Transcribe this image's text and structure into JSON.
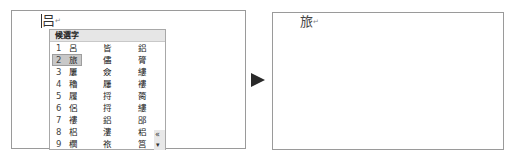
{
  "left_panel": {
    "typed_text": "吕",
    "paragraph_mark": "↵",
    "candidate_popup": {
      "header": "候選字",
      "selected_index": 2,
      "rows": [
        {
          "num": "1",
          "c1": "呂",
          "c2": "皆",
          "c3": "鋁"
        },
        {
          "num": "2",
          "c1": "旅",
          "c2": "儘",
          "c3": "膂"
        },
        {
          "num": "3",
          "c1": "屢",
          "c2": "僉",
          "c3": "縷"
        },
        {
          "num": "4",
          "c1": "穭",
          "c2": "屨",
          "c3": "褸"
        },
        {
          "num": "5",
          "c1": "履",
          "c2": "捋",
          "c3": "膐"
        },
        {
          "num": "6",
          "c1": "侶",
          "c2": "捋",
          "c3": "縷"
        },
        {
          "num": "7",
          "c1": "褸",
          "c2": "鋁",
          "c3": "郘"
        },
        {
          "num": "8",
          "c1": "梠",
          "c2": "漊",
          "c3": "稆"
        },
        {
          "num": "9",
          "c1": "櫚",
          "c2": "祣",
          "c3": "筥"
        }
      ],
      "scroll_up_glyph": "«",
      "scroll_down_glyph": "▾"
    }
  },
  "transition_arrow": "►",
  "right_panel": {
    "result_text": "旅",
    "paragraph_mark": "↵"
  }
}
